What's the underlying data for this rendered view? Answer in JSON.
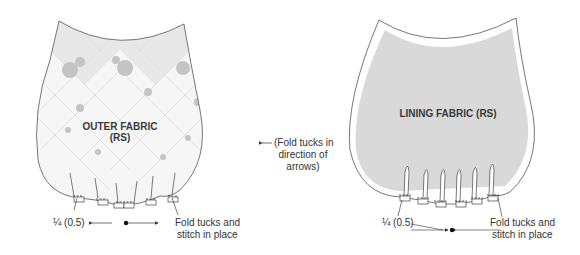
{
  "diagram": {
    "colors": {
      "outline": "#555555",
      "lining_fill": "#d8d8d8",
      "outer_fill_light": "#f4f4f4",
      "outer_fill_dark": "#e6e6e6",
      "rose": "#bdbdbd",
      "text": "#333333"
    },
    "outer_panel": {
      "title_line1": "OUTER FABRIC",
      "title_line2": "(RS)",
      "seam_label": "¼ (0.5)",
      "callout_line1": "Fold tucks and",
      "callout_line2": "stitch in place"
    },
    "center_note": {
      "line1": "(Fold tucks in",
      "line2": "direction of",
      "line3": "arrows)"
    },
    "lining_panel": {
      "title": "LINING FABRIC (RS)",
      "seam_label": "¼ (0.5)",
      "callout_line1": "Fold tucks and",
      "callout_line2": "stitch in place"
    }
  }
}
